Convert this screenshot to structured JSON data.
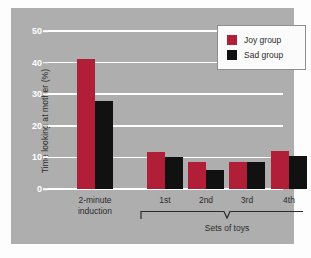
{
  "chart_data": {
    "type": "bar",
    "title": "",
    "xlabel": "Sets of toys",
    "ylabel": "Time looking at mother (%)",
    "categories": [
      "2-minute induction",
      "1st",
      "2nd",
      "3rd",
      "4th"
    ],
    "category_lines": [
      [
        "2-minute",
        "induction"
      ],
      [
        "1st"
      ],
      [
        "2nd"
      ],
      [
        "3rd"
      ],
      [
        "4th"
      ]
    ],
    "series": [
      {
        "name": "Joy group",
        "color": "#b01e38",
        "values": [
          41,
          11.8,
          8.5,
          8.5,
          12
        ]
      },
      {
        "name": "Sad group",
        "color": "#111111",
        "values": [
          27.8,
          10,
          6,
          8.5,
          10.3
        ]
      }
    ],
    "ylim": [
      0,
      50
    ],
    "ytick_values": [
      0,
      10,
      20,
      30,
      40,
      50
    ],
    "ytick_labels": [
      "0",
      "10",
      "20",
      "30",
      "40",
      "50"
    ],
    "grid": true,
    "legend_position": "top-right",
    "bracket": {
      "label": "Sets of toys",
      "spans_categories": [
        "1st",
        "2nd",
        "3rd",
        "4th"
      ]
    },
    "panel_background": "#aeaeae",
    "gridline_color": "#ffffff"
  },
  "legend": {
    "entries": [
      {
        "label": "Joy group",
        "color": "#b01e38"
      },
      {
        "label": "Sad group",
        "color": "#111111"
      }
    ]
  },
  "axes": {
    "y_title": "Time looking at mother (%)",
    "x_bracket_title": "Sets of toys"
  }
}
